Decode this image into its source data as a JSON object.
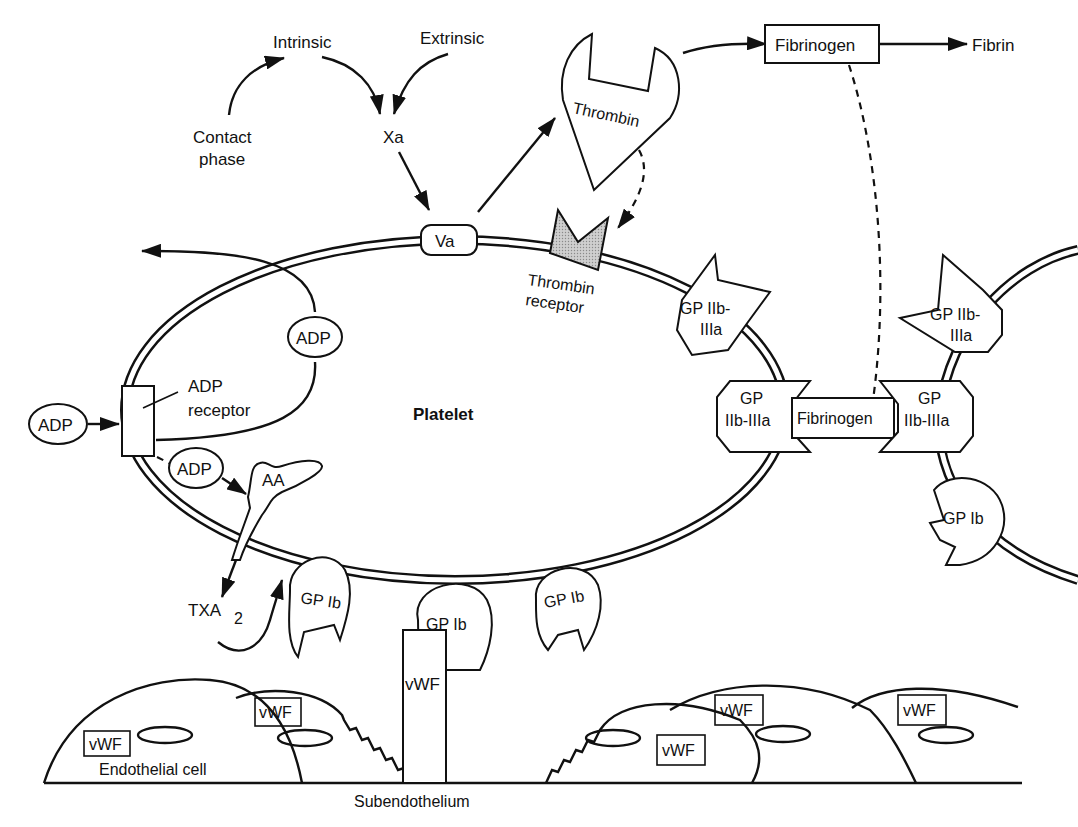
{
  "diagram": {
    "cascade": {
      "intrinsic": "Intrinsic",
      "extrinsic": "Extrinsic",
      "contact_line1": "Contact",
      "contact_line2": "phase",
      "xa": "Xa",
      "va": "Va",
      "thrombin": "Thrombin",
      "fibrinogen": "Fibrinogen",
      "fibrin": "Fibrin"
    },
    "platelet": {
      "label": "Platelet",
      "thrombin_receptor_line1": "Thrombin",
      "thrombin_receptor_line2": "receptor",
      "adp_receptor_line1": "ADP",
      "adp_receptor_line2": "receptor",
      "adp_inside": "ADP",
      "adp_outside": "ADP",
      "adp_lower": "ADP",
      "aa": "AA",
      "txa": "TXA",
      "txa_sub": "2",
      "gp2b3a_top_line1": "GP IIb-",
      "gp2b3a_top_line2": "IIIa",
      "gp2b3a_bridge_line1": "GP",
      "gp2b3a_bridge_line2": "IIb-IIIa",
      "gp1b_left": "GP Ib",
      "gp1b_center": "GP Ib",
      "gp1b_right": "GP Ib"
    },
    "bridge": {
      "fibrinogen": "Fibrinogen"
    },
    "second_platelet": {
      "gp2b3a_top_line1": "GP IIb-",
      "gp2b3a_top_line2": "IIIa",
      "gp2b3a_bridge_line1": "GP",
      "gp2b3a_bridge_line2": "IIb-IIIa",
      "gp1b": "GP Ib"
    },
    "vessel": {
      "vwf_column": "vWF",
      "vwf_labels": [
        "vWF",
        "vWF",
        "vWF",
        "vWF",
        "vWF"
      ],
      "endothelial_cell": "Endothelial cell",
      "subendothelium": "Subendothelium"
    }
  }
}
